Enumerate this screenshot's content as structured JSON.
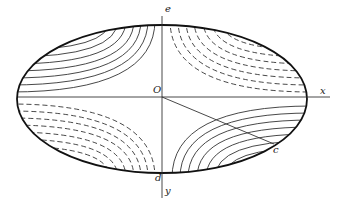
{
  "diagram": {
    "type": "elliptical contour diagram",
    "labels": {
      "origin": "O",
      "x_axis": "x",
      "y_axis": "y",
      "top_point": "e",
      "bottom_point": "d",
      "radial_point": "c"
    },
    "regions": [
      {
        "quadrant": "upper-left",
        "line_style": "solid",
        "curve_count": 7
      },
      {
        "quadrant": "upper-right",
        "line_style": "dashed",
        "curve_count": 7
      },
      {
        "quadrant": "lower-left",
        "line_style": "dashed",
        "curve_count": 7
      },
      {
        "quadrant": "lower-right",
        "line_style": "solid",
        "curve_count": 7
      }
    ],
    "colors": {
      "line": "#222222",
      "background": "#ffffff"
    }
  }
}
